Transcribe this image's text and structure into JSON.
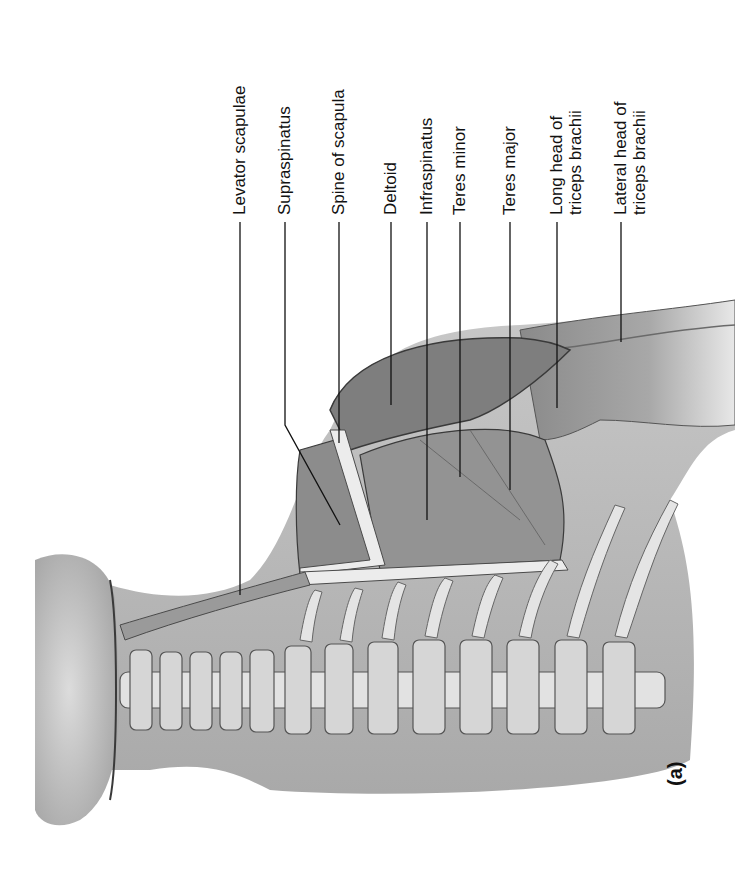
{
  "figure": {
    "panel_letter": "(a)",
    "labels": [
      {
        "id": "levator-scapulae",
        "lines": [
          "Levator scapulae"
        ],
        "x": 240,
        "line_top": 222,
        "line_end": [
          240,
          570
        ]
      },
      {
        "id": "supraspinatus",
        "lines": [
          "Supraspinatus"
        ],
        "x": 285,
        "line_top": 222,
        "line_end": [
          335,
          530
        ],
        "bend": [
          285,
          425
        ]
      },
      {
        "id": "spine-of-scapula",
        "lines": [
          "Spine of scapula"
        ],
        "x": 339,
        "line_top": 222,
        "line_end": [
          339,
          443
        ]
      },
      {
        "id": "deltoid",
        "lines": [
          "Deltoid"
        ],
        "x": 391,
        "line_top": 222,
        "line_end": [
          391,
          405
        ]
      },
      {
        "id": "infraspinatus",
        "lines": [
          "Infraspinatus"
        ],
        "x": 427,
        "line_top": 222,
        "line_end": [
          427,
          520
        ]
      },
      {
        "id": "teres-minor",
        "lines": [
          "Teres minor"
        ],
        "x": 460,
        "line_top": 222,
        "line_end": [
          460,
          477
        ]
      },
      {
        "id": "teres-major",
        "lines": [
          "Teres major"
        ],
        "x": 510,
        "line_top": 222,
        "line_end": [
          510,
          490
        ]
      },
      {
        "id": "long-head-triceps",
        "lines": [
          "Long head of",
          "triceps brachii"
        ],
        "x": 557,
        "line_top": 222,
        "line_end": [
          557,
          408
        ]
      },
      {
        "id": "lateral-head-triceps",
        "lines": [
          "Lateral head of",
          "triceps brachii"
        ],
        "x": 621,
        "line_top": 222,
        "line_end": [
          621,
          342
        ]
      }
    ]
  },
  "colors": {
    "background": "#ffffff",
    "skin": "#b9b9b9",
    "muscle": "#8f8f8f",
    "bone": "#e6e6e6",
    "outline": "#3a3a3a",
    "text": "#111111"
  }
}
